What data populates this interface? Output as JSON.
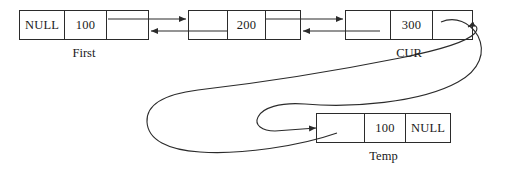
{
  "diagram": {
    "stroke_color": "#2b2b2b",
    "background_color": "#ffffff",
    "nodes": [
      {
        "id": "node-first",
        "label": "First",
        "cells": [
          "NULL",
          "100",
          ""
        ],
        "x": 19,
        "y": 10,
        "width": 130,
        "height": 30,
        "cell_widths": [
          44,
          42,
          44
        ],
        "label_x": 19,
        "label_y": 45,
        "label_width": 130
      },
      {
        "id": "node-second",
        "label": "",
        "cells": [
          "",
          "200",
          ""
        ],
        "x": 188,
        "y": 10,
        "width": 113,
        "height": 30,
        "cell_widths": [
          38,
          38,
          37
        ],
        "label_x": 188,
        "label_y": 45,
        "label_width": 113
      },
      {
        "id": "node-cur",
        "label": "CUR",
        "cells": [
          "",
          "300",
          ""
        ],
        "x": 345,
        "y": 10,
        "width": 128,
        "height": 30,
        "cell_widths": [
          44,
          42,
          42
        ],
        "label_x": 345,
        "label_y": 45,
        "label_width": 128
      },
      {
        "id": "node-temp",
        "label": "Temp",
        "cells": [
          "",
          "100",
          "NULL"
        ],
        "x": 316,
        "y": 113,
        "width": 135,
        "height": 30,
        "cell_widths": [
          47,
          41,
          47
        ],
        "label_x": 316,
        "label_y": 148,
        "label_width": 135
      }
    ],
    "connectors": [
      {
        "id": "first-next-to-second",
        "kind": "straight-arrow",
        "direction": "right",
        "from": "node-first.next-cell",
        "to": "node-second.prev-cell",
        "x1": 108,
        "y1": 19,
        "x2": 187,
        "y2": 19
      },
      {
        "id": "second-prev-to-first",
        "kind": "straight-arrow",
        "direction": "left",
        "from": "node-second.prev-cell",
        "to": "node-first.next-cell",
        "x1": 188,
        "y1": 31,
        "x2": 150,
        "y2": 31
      },
      {
        "id": "second-next-to-cur",
        "kind": "straight-arrow",
        "direction": "right",
        "from": "node-second.next-cell",
        "to": "node-cur.prev-cell",
        "x1": 265,
        "y1": 19,
        "x2": 344,
        "y2": 19
      },
      {
        "id": "cur-prev-to-second",
        "kind": "straight-arrow",
        "direction": "left",
        "from": "node-cur.prev-cell",
        "to": "node-second.next-cell",
        "x1": 345,
        "y1": 31,
        "x2": 302,
        "y2": 31
      },
      {
        "id": "cur-next-to-temp",
        "kind": "curved-arrow",
        "direction": "down-left",
        "from": "node-cur.next-cell",
        "to": "node-temp.prev-cell"
      },
      {
        "id": "temp-prev-to-cur",
        "kind": "curved-arrow",
        "direction": "loop-right-up",
        "from": "node-temp.prev-cell",
        "to": "node-cur.right-edge"
      }
    ]
  }
}
